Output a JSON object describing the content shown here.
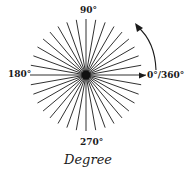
{
  "diagram": {
    "title": "Degree",
    "center": {
      "x": 86,
      "y": 75
    },
    "radius": 56,
    "ray_step_degrees": 10,
    "ray_count": 36,
    "line_color": "#1a1a1a",
    "labels": {
      "top": "90°",
      "left": "180°",
      "bottom": "270°",
      "right": "0°/360°"
    },
    "rotation_arrow": {
      "direction": "counterclockwise"
    }
  }
}
